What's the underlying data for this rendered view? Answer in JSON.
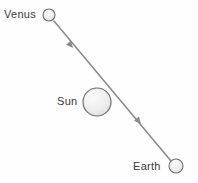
{
  "diagram": {
    "background_color": "#fefefe",
    "line_color": "#8c8c8c",
    "outline_color": "#6e6e6e",
    "label_color": "#3a3a3a",
    "bodies": [
      {
        "id": "venus",
        "label": "Venus",
        "cx": 49,
        "cy": 15,
        "r": 6,
        "fill": "#f2f2f2",
        "label_x": 4,
        "label_y": 9
      },
      {
        "id": "sun",
        "label": "Sun",
        "cx": 97,
        "cy": 102,
        "r": 14,
        "fill": "#ededed",
        "label_x": 57,
        "label_y": 96
      },
      {
        "id": "earth",
        "label": "Earth",
        "cx": 176,
        "cy": 166,
        "r": 7,
        "fill": "#ededed",
        "label_x": 133,
        "label_y": 161
      }
    ],
    "sight_line": {
      "id": "venus-earth-line",
      "x1": 54,
      "y1": 21,
      "x2": 171,
      "y2": 161,
      "stroke_width": 1.6,
      "direction": "from Earth toward Venus"
    },
    "arrow_markers": [
      {
        "id": "arrow-upper",
        "x": 73,
        "y": 48,
        "angle_deg": 230
      },
      {
        "id": "arrow-lower",
        "x": 141,
        "y": 124,
        "angle_deg": 230
      }
    ]
  }
}
